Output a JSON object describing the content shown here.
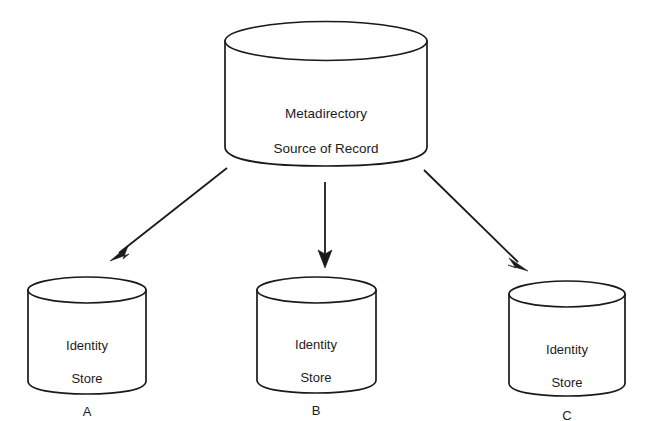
{
  "diagram": {
    "background_color": "#ffffff",
    "line_color": "#1a1a1a",
    "text_color": "#1c1c1c",
    "nodes": {
      "root": {
        "shape": "cylinder",
        "name": "metadirectory-source-of-record",
        "label_line1": "Metadirectory",
        "label_line2": "Source of Record"
      },
      "store_a": {
        "shape": "cylinder",
        "name": "identity-store-a",
        "label_line1": "Identity",
        "label_line2": "Store",
        "label_line3": "A"
      },
      "store_b": {
        "shape": "cylinder",
        "name": "identity-store-b",
        "label_line1": "Identity",
        "label_line2": "Store",
        "label_line3": "B"
      },
      "store_c": {
        "shape": "cylinder",
        "name": "identity-store-c",
        "label_line1": "Identity",
        "label_line2": "Store",
        "label_line3": "C"
      }
    },
    "edges": [
      {
        "name": "arrow-root-to-store-a",
        "from": "root",
        "to": "store_a",
        "direction": "down-left"
      },
      {
        "name": "arrow-root-to-store-b",
        "from": "root",
        "to": "store_b",
        "direction": "down"
      },
      {
        "name": "arrow-root-to-store-c",
        "from": "root",
        "to": "store_c",
        "direction": "down-right"
      }
    ]
  }
}
